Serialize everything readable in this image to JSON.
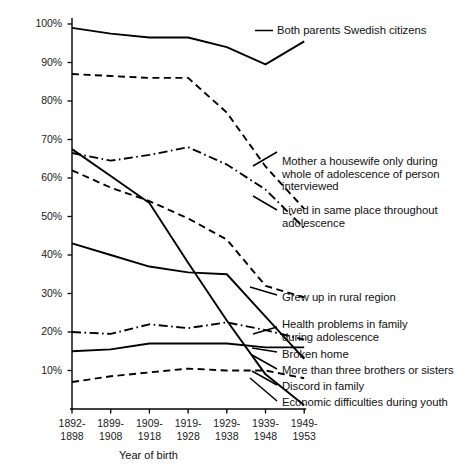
{
  "chart_data": {
    "type": "line",
    "title": "",
    "xlabel": "Year of birth",
    "ylabel": "",
    "ylim": [
      0,
      100
    ],
    "ytick_labels": [
      "100%",
      "90%",
      "80%",
      "70%",
      "60%",
      "50%",
      "40%",
      "30%",
      "20%",
      "10%"
    ],
    "ytick_values": [
      100,
      90,
      80,
      70,
      60,
      50,
      40,
      30,
      20,
      10
    ],
    "categories": [
      "1892-\n1898",
      "1899-\n1908",
      "1909-\n1918",
      "1919-\n1928",
      "1929-\n1938",
      "1939-\n1948",
      "1949-\n1953"
    ],
    "grid": false,
    "legend_position": "right-inline-labels",
    "series": [
      {
        "name": "Both parents Swedish citizens",
        "style": "solid",
        "values": [
          99,
          97.5,
          96.5,
          96.5,
          94,
          89.5,
          95.5
        ],
        "label_text": "Both parents Swedish citizens"
      },
      {
        "name": "Mother a housewife only during whole of adolescence of person interviewed",
        "style": "dashed",
        "values": [
          87,
          86.5,
          86,
          86,
          77,
          63,
          52
        ],
        "label_text": "Mother a housewife only during\nwhole of adolescence of person\ninterviewed"
      },
      {
        "name": "Lived in same place throughout adolescence",
        "style": "dash-dot",
        "values": [
          66.5,
          64.5,
          66,
          68,
          63.5,
          57,
          47
        ],
        "label_text": "Lived in same place throughout\nadolescence"
      },
      {
        "name": "Grew up in rural region",
        "style": "dashed",
        "values": [
          62,
          57.5,
          54,
          49.5,
          44,
          32,
          29
        ],
        "label_text": "Grew up in rural region"
      },
      {
        "name": "More than three brothers or sisters",
        "style": "solid",
        "values": [
          43,
          40,
          37,
          35.5,
          35,
          24,
          13
        ],
        "label_text": "More than three brothers or sisters"
      },
      {
        "name": "Health problems in family during adolescence",
        "style": "dash-dot",
        "values": [
          20,
          19.5,
          22,
          21,
          22.5,
          20.5,
          18
        ],
        "label_text": "Health problems in family\nduring adolescence"
      },
      {
        "name": "Broken home",
        "style": "solid",
        "values": [
          15,
          15.5,
          17,
          17,
          17,
          16,
          16
        ],
        "label_text": "Broken home"
      },
      {
        "name": "Discord in family",
        "style": "dashed",
        "values": [
          7,
          8.5,
          9.5,
          10.5,
          10,
          10,
          8
        ],
        "label_text": "Discord in family"
      },
      {
        "name": "Economic difficulties during youth",
        "style": "solid",
        "values": [
          67.5,
          60.5,
          53.5,
          38,
          23,
          9,
          1
        ],
        "label_text": "Economic difficulties during youth"
      }
    ]
  },
  "axis": {
    "x_title": "Year of birth"
  },
  "header": {
    "cut_off_text": ""
  }
}
